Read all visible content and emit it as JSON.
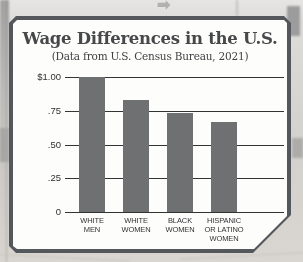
{
  "background": {
    "arrow_icon_glyph": "➡"
  },
  "card": {
    "title": "Wage Differences in the U.S.",
    "subtitle": "(Data from U.S. Census Bureau, 2021)"
  },
  "chart_data": {
    "type": "bar",
    "title": "Wage Differences in the U.S.",
    "subtitle": "(Data from U.S. Census Bureau, 2021)",
    "categories": [
      "WHITE\nMEN",
      "WHITE\nWOMEN",
      "BLACK\nWOMEN",
      "HISPANIC\nOR LATINO\nWOMEN"
    ],
    "values": [
      1.0,
      0.83,
      0.73,
      0.67
    ],
    "unit": "dollars earned per $1.00",
    "ylim": [
      0,
      1.0
    ],
    "yticks": [
      {
        "label": "$1.00",
        "value": 1.0
      },
      {
        "label": ".75",
        "value": 0.75
      },
      {
        "label": ".50",
        "value": 0.5
      },
      {
        "label": ".25",
        "value": 0.25
      },
      {
        "label": "0",
        "value": 0.0
      }
    ],
    "grid": true,
    "legend": null,
    "bar_color": "#6e7072"
  },
  "colors": {
    "card_border": "#54575b",
    "card_background": "#fdfdfc",
    "bar": "#6e7072",
    "gridline": "#333435",
    "title_text": "#474849"
  }
}
